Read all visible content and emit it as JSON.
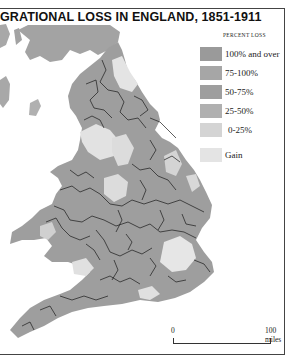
{
  "title": "GRATIONAL LOSS IN ENGLAND, 1851-1911",
  "legend": {
    "heading": "PERCENT LOSS",
    "items": [
      {
        "label": "100% and over",
        "color": "#9a9a9a"
      },
      {
        "label": "75-100%",
        "color": "#a6a6a6"
      },
      {
        "label": "50-75%",
        "color": "#9e9e9e"
      },
      {
        "label": "25-50%",
        "color": "#b0b0b0"
      },
      {
        "label": " 0-25%",
        "color": "#d4d4d4"
      },
      {
        "label": "Gain",
        "color": "#e4e4e4"
      }
    ]
  },
  "scale": {
    "start_label": "0",
    "end_label": "100 miles"
  },
  "colors": {
    "scotland": "#a3a3a3",
    "ireland": "#a8a8a8",
    "high_loss": "#9c9c9c",
    "low_loss": "#d9d9d9",
    "gain": "#e6e6e6",
    "boundary": "#1a1a1a",
    "frame": "#444444"
  }
}
